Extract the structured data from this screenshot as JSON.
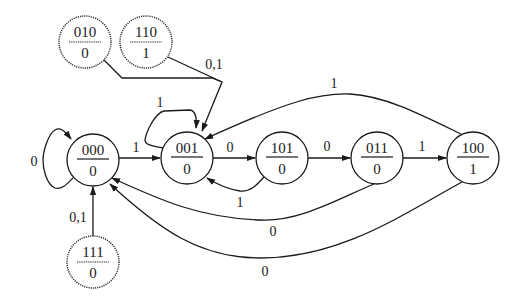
{
  "diagram": {
    "type": "Moore state transition diagram",
    "states": [
      {
        "id": "s000",
        "code": "000",
        "output": "0",
        "reachable": true
      },
      {
        "id": "s001",
        "code": "001",
        "output": "0",
        "reachable": true
      },
      {
        "id": "s101",
        "code": "101",
        "output": "0",
        "reachable": true
      },
      {
        "id": "s011",
        "code": "011",
        "output": "0",
        "reachable": true
      },
      {
        "id": "s100",
        "code": "100",
        "output": "1",
        "reachable": true
      },
      {
        "id": "s010",
        "code": "010",
        "output": "0",
        "reachable": false
      },
      {
        "id": "s110",
        "code": "110",
        "output": "1",
        "reachable": false
      },
      {
        "id": "s111",
        "code": "111",
        "output": "0",
        "reachable": false
      }
    ],
    "transitions": [
      {
        "from": "000",
        "to": "000",
        "label": "0"
      },
      {
        "from": "000",
        "to": "001",
        "label": "1"
      },
      {
        "from": "001",
        "to": "001",
        "label": "1"
      },
      {
        "from": "001",
        "to": "101",
        "label": "0"
      },
      {
        "from": "101",
        "to": "011",
        "label": "0"
      },
      {
        "from": "101",
        "to": "001",
        "label": "1"
      },
      {
        "from": "011",
        "to": "100",
        "label": "1"
      },
      {
        "from": "011",
        "to": "000",
        "label": "0"
      },
      {
        "from": "100",
        "to": "001",
        "label": "1"
      },
      {
        "from": "100",
        "to": "000",
        "label": "0"
      },
      {
        "from": "010",
        "to": "001",
        "label": "0,1"
      },
      {
        "from": "110",
        "to": "001",
        "label": "0,1"
      },
      {
        "from": "111",
        "to": "000",
        "label": "0,1"
      }
    ],
    "labels": {
      "self_000": "0",
      "e000_001": "1",
      "self_001": "1",
      "e001_101": "0",
      "e101_011": "0",
      "e101_001": "1",
      "e011_100": "1",
      "e011_000": "0",
      "e100_001": "1",
      "e100_000": "0",
      "e_unused_top": "0,1",
      "e111_000": "0,1"
    }
  }
}
